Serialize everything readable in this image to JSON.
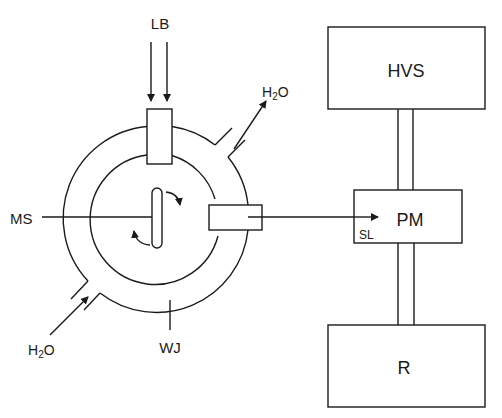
{
  "diagram": {
    "labels": {
      "lb": "LB",
      "h2o_out": "H2O",
      "h2o_in": "H2O",
      "ms": "MS",
      "wj": "WJ",
      "sl": "SL"
    },
    "h2o_parts": {
      "h": "H",
      "sub": "2",
      "o": "O"
    },
    "blocks": {
      "hvs": "HVS",
      "pm": "PM",
      "r": "R"
    },
    "colors": {
      "line": "#1a1a1a",
      "background": "#ffffff"
    }
  }
}
